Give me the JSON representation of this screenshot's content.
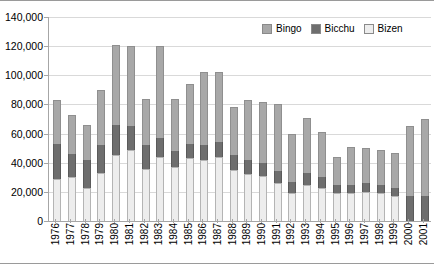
{
  "chart_data": {
    "type": "bar",
    "subtype": "stacked-column",
    "title": "",
    "xlabel": "",
    "ylabel": "",
    "ylim": [
      0,
      140000
    ],
    "ytick_labels": [
      "0",
      "20,000",
      "40,000",
      "60,000",
      "80,000",
      "100,000",
      "120,000",
      "140,000"
    ],
    "ytick_values": [
      0,
      20000,
      40000,
      60000,
      80000,
      100000,
      120000,
      140000
    ],
    "grid": true,
    "legend_position": "top-right",
    "categories": [
      "1976",
      "1977",
      "1978",
      "1979",
      "1980",
      "1981",
      "1982",
      "1983",
      "1984",
      "1985",
      "1986",
      "1987",
      "1988",
      "1989",
      "1990",
      "1991",
      "1992",
      "1993",
      "1994",
      "1995",
      "1996",
      "1997",
      "1998",
      "1999",
      "2000",
      "2001"
    ],
    "series": [
      {
        "name": "Bizen",
        "color": "#ededed",
        "values": [
          29000,
          30000,
          23000,
          33000,
          45000,
          49000,
          36000,
          44000,
          37000,
          43000,
          42000,
          44000,
          35000,
          32000,
          31000,
          26000,
          19000,
          25000,
          23000,
          19000,
          19000,
          20000,
          19000,
          17000,
          0,
          0
        ]
      },
      {
        "name": "Bicchu",
        "color": "#6e6e6e",
        "values": [
          24000,
          16000,
          19000,
          19000,
          21000,
          16000,
          16000,
          13000,
          11000,
          10000,
          10000,
          10000,
          10000,
          10000,
          9000,
          8000,
          8000,
          8000,
          7000,
          6000,
          6000,
          6000,
          6000,
          6000,
          17000,
          17000
        ]
      },
      {
        "name": "Bingo",
        "color": "#a8a8a8",
        "values": [
          30000,
          27000,
          24000,
          38000,
          55000,
          55000,
          32000,
          63000,
          36000,
          41000,
          50000,
          48000,
          33000,
          41000,
          42000,
          46000,
          33000,
          38000,
          31000,
          19000,
          26000,
          24000,
          24000,
          24000,
          48000,
          53000
        ]
      }
    ],
    "totals": [
      83000,
      73000,
      66000,
      90000,
      121000,
      120000,
      84000,
      120000,
      84000,
      94000,
      102000,
      102000,
      78000,
      83000,
      82000,
      80000,
      60000,
      71000,
      61000,
      44000,
      51000,
      50000,
      49000,
      47000,
      65000,
      70000
    ]
  },
  "legend": {
    "items": [
      {
        "label": "Bingo",
        "color": "#a8a8a8"
      },
      {
        "label": "Bicchu",
        "color": "#6e6e6e"
      },
      {
        "label": "Bizen",
        "color": "#ededed"
      }
    ]
  }
}
